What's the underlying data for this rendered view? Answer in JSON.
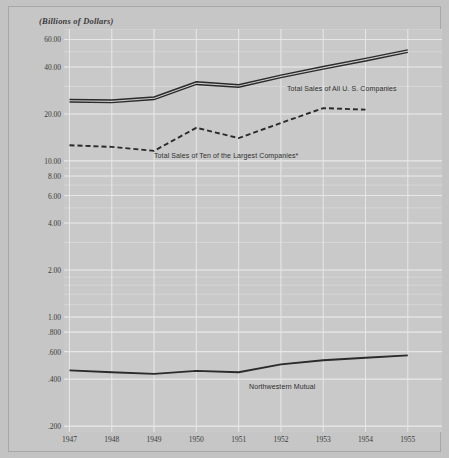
{
  "figure": {
    "unit_caption": "(Billions of Dollars)",
    "background_color": "#c6c6c6",
    "plot_background_color": "#c9c9c9",
    "grid_color": "#e8e8e8",
    "line_color": "#2a2a2a"
  },
  "chart_data": {
    "type": "line",
    "title": "",
    "subtitle": "",
    "xlabel": "",
    "ylabel": "(Billions of Dollars)",
    "y_scale": "log",
    "ylim": [
      0.2,
      70
    ],
    "grid": true,
    "legend_position": "inline-annotations",
    "x": [
      "1947",
      "1948",
      "1949",
      "1950",
      "1951",
      "1952",
      "1953",
      "1954",
      "1955"
    ],
    "y_ticks": [
      "60.00",
      "40.00",
      "20.00",
      "10.00",
      "8.00",
      "6.00",
      "4.00",
      "2.00",
      "1.00",
      ".800",
      ".600",
      ".400",
      ".200"
    ],
    "y_tick_values": [
      60,
      40,
      20,
      10,
      8,
      6,
      4,
      2,
      1,
      0.8,
      0.6,
      0.4,
      0.2
    ],
    "series": [
      {
        "name": "Total Sales of All U. S. Companies",
        "style": "double-solid",
        "values": [
          24.3,
          24.1,
          25.2,
          31.5,
          30.2,
          34.8,
          39.5,
          44.5,
          50.5
        ]
      },
      {
        "name": "Total Sales of Ten of the Largest Companies*",
        "style": "dashed",
        "values": [
          12.6,
          12.3,
          11.6,
          16.3,
          14.0,
          17.5,
          21.8,
          21.3,
          null
        ]
      },
      {
        "name": "Northwestern Mutual",
        "style": "solid",
        "values": [
          0.455,
          0.443,
          0.432,
          0.452,
          0.443,
          0.497,
          0.528,
          0.548,
          0.568
        ]
      }
    ],
    "annotations": [
      {
        "text": "Total Sales of All U. S. Companies",
        "x_px": 278,
        "y_px": 78
      },
      {
        "text": "Total Sales of Ten of the Largest Companies*",
        "x_px": 145,
        "y_px": 145
      },
      {
        "text": "Northwestern Mutual",
        "x_px": 240,
        "y_px": 376
      }
    ]
  }
}
